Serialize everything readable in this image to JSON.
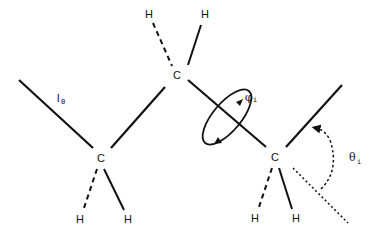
{
  "diagram": {
    "title": "",
    "atoms": {
      "carbon_left": "C",
      "carbon_top": "C",
      "carbon_right": "C",
      "hydrogen": "H"
    },
    "labels": {
      "bond_length": {
        "symbol": "l",
        "subscript": "0"
      },
      "torsion_angle": {
        "symbol": "φ",
        "subscript": "i"
      },
      "bond_angle": {
        "symbol": "θ",
        "subscript": "i"
      }
    },
    "colors": {
      "stroke": "#111111",
      "background": "#ffffff"
    }
  }
}
